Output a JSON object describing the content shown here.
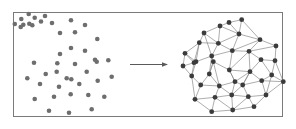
{
  "figure": {
    "background_color": "#ffffff",
    "frame": {
      "x": 13.5,
      "y": 12.5,
      "width": 269,
      "height": 104,
      "stroke": "#7a7a7a",
      "stroke_width": 1,
      "fill": "#ffffff"
    },
    "colors": {
      "point_fill": "#6e6e6e",
      "node_fill": "#3b3b3b",
      "edge_stroke": "#8a8a8a",
      "arrow_stroke": "#5a5a5a",
      "frame_stroke": "#7a7a7a"
    }
  },
  "left_panel": {
    "label": "scattered-point-cloud",
    "point_radius": 2.3,
    "point_count": 44,
    "points": [
      {
        "x": 28.7,
        "y": 14.0
      },
      {
        "x": 34.7,
        "y": 17.7
      },
      {
        "x": 21.3,
        "y": 19.0
      },
      {
        "x": 23.3,
        "y": 24.7
      },
      {
        "x": 20.7,
        "y": 27.0
      },
      {
        "x": 14.8,
        "y": 24.0
      },
      {
        "x": 29.3,
        "y": 23.7
      },
      {
        "x": 32.3,
        "y": 25.3
      },
      {
        "x": 45.0,
        "y": 16.0
      },
      {
        "x": 41.0,
        "y": 21.5
      },
      {
        "x": 52.0,
        "y": 23.0
      },
      {
        "x": 60.0,
        "y": 33.0
      },
      {
        "x": 71.0,
        "y": 20.3
      },
      {
        "x": 75.0,
        "y": 32.3
      },
      {
        "x": 85.0,
        "y": 25.0
      },
      {
        "x": 97.3,
        "y": 39.0
      },
      {
        "x": 71.0,
        "y": 48.0
      },
      {
        "x": 85.0,
        "y": 50.7
      },
      {
        "x": 60.0,
        "y": 54.0
      },
      {
        "x": 95.0,
        "y": 59.7
      },
      {
        "x": 108.3,
        "y": 60.3
      },
      {
        "x": 34.0,
        "y": 62.7
      },
      {
        "x": 57.3,
        "y": 63.3
      },
      {
        "x": 27.3,
        "y": 78.3
      },
      {
        "x": 45.7,
        "y": 74.0
      },
      {
        "x": 56.7,
        "y": 71.7
      },
      {
        "x": 71.3,
        "y": 79.3
      },
      {
        "x": 40.0,
        "y": 84.0
      },
      {
        "x": 59.0,
        "y": 86.7
      },
      {
        "x": 34.7,
        "y": 99.0
      },
      {
        "x": 54.0,
        "y": 96.7
      },
      {
        "x": 70.7,
        "y": 94.3
      },
      {
        "x": 49.0,
        "y": 110.7
      },
      {
        "x": 69.0,
        "y": 112.7
      },
      {
        "x": 75.0,
        "y": 64.0
      },
      {
        "x": 96.7,
        "y": 61.7
      },
      {
        "x": 86.7,
        "y": 71.7
      },
      {
        "x": 66.7,
        "y": 78.3
      },
      {
        "x": 97.7,
        "y": 80.7
      },
      {
        "x": 79.3,
        "y": 84.0
      },
      {
        "x": 88.3,
        "y": 95.0
      },
      {
        "x": 104.3,
        "y": 96.7
      },
      {
        "x": 91.7,
        "y": 109.3
      },
      {
        "x": 111.7,
        "y": 76.7
      }
    ]
  },
  "arrow": {
    "label": "transformation-arrow",
    "x1": 130,
    "y1": 64.5,
    "x2": 168,
    "y2": 64.5,
    "head_length": 6,
    "head_width": 4.5,
    "stroke_width": 1
  },
  "right_panel": {
    "label": "connected-graph",
    "node_radius": 2.4,
    "node_count": 38,
    "edge_count": 92,
    "nodes": [
      {
        "id": 0,
        "x": 220.0,
        "y": 26.0
      },
      {
        "id": 1,
        "x": 241.7,
        "y": 19.7
      },
      {
        "id": 2,
        "x": 199.3,
        "y": 42.7
      },
      {
        "id": 3,
        "x": 218.3,
        "y": 43.3
      },
      {
        "id": 4,
        "x": 239.0,
        "y": 34.0
      },
      {
        "id": 5,
        "x": 260.0,
        "y": 39.7
      },
      {
        "id": 6,
        "x": 185.0,
        "y": 53.3
      },
      {
        "id": 7,
        "x": 196.0,
        "y": 61.7
      },
      {
        "id": 8,
        "x": 211.7,
        "y": 56.0
      },
      {
        "id": 9,
        "x": 232.3,
        "y": 50.7
      },
      {
        "id": 10,
        "x": 249.0,
        "y": 51.3
      },
      {
        "id": 11,
        "x": 261.0,
        "y": 59.7
      },
      {
        "id": 12,
        "x": 275.0,
        "y": 60.7
      },
      {
        "id": 13,
        "x": 194.0,
        "y": 62.7
      },
      {
        "id": 14,
        "x": 213.3,
        "y": 61.7
      },
      {
        "id": 15,
        "x": 229.3,
        "y": 70.0
      },
      {
        "id": 16,
        "x": 191.7,
        "y": 76.0
      },
      {
        "id": 17,
        "x": 209.3,
        "y": 74.0
      },
      {
        "id": 18,
        "x": 250.0,
        "y": 71.7
      },
      {
        "id": 19,
        "x": 271.7,
        "y": 75.0
      },
      {
        "id": 20,
        "x": 200.7,
        "y": 85.0
      },
      {
        "id": 21,
        "x": 219.3,
        "y": 86.0
      },
      {
        "id": 22,
        "x": 235.0,
        "y": 81.7
      },
      {
        "id": 23,
        "x": 261.7,
        "y": 80.7
      },
      {
        "id": 24,
        "x": 283.3,
        "y": 81.7
      },
      {
        "id": 25,
        "x": 242.7,
        "y": 85.0
      },
      {
        "id": 26,
        "x": 195.0,
        "y": 99.3
      },
      {
        "id": 27,
        "x": 215.0,
        "y": 97.3
      },
      {
        "id": 28,
        "x": 231.7,
        "y": 95.0
      },
      {
        "id": 29,
        "x": 248.3,
        "y": 96.7
      },
      {
        "id": 30,
        "x": 266.0,
        "y": 95.0
      },
      {
        "id": 31,
        "x": 211.7,
        "y": 111.7
      },
      {
        "id": 32,
        "x": 232.7,
        "y": 110.0
      },
      {
        "id": 33,
        "x": 254.0,
        "y": 106.7
      },
      {
        "id": 34,
        "x": 183.0,
        "y": 66.0
      },
      {
        "id": 35,
        "x": 276.0,
        "y": 46.0
      },
      {
        "id": 36,
        "x": 204.0,
        "y": 33.0
      },
      {
        "id": 37,
        "x": 229.0,
        "y": 22.5
      }
    ],
    "edges": [
      [
        0,
        37
      ],
      [
        0,
        36
      ],
      [
        0,
        3
      ],
      [
        0,
        4
      ],
      [
        37,
        1
      ],
      [
        37,
        4
      ],
      [
        1,
        4
      ],
      [
        1,
        5
      ],
      [
        36,
        2
      ],
      [
        36,
        3
      ],
      [
        2,
        3
      ],
      [
        2,
        6
      ],
      [
        2,
        13
      ],
      [
        3,
        4
      ],
      [
        3,
        8
      ],
      [
        3,
        9
      ],
      [
        4,
        9
      ],
      [
        4,
        5
      ],
      [
        5,
        9
      ],
      [
        5,
        10
      ],
      [
        5,
        35
      ],
      [
        35,
        12
      ],
      [
        35,
        10
      ],
      [
        6,
        7
      ],
      [
        6,
        13
      ],
      [
        6,
        34
      ],
      [
        7,
        8
      ],
      [
        7,
        13
      ],
      [
        7,
        16
      ],
      [
        8,
        9
      ],
      [
        8,
        14
      ],
      [
        8,
        17
      ],
      [
        9,
        10
      ],
      [
        9,
        15
      ],
      [
        10,
        11
      ],
      [
        10,
        15
      ],
      [
        10,
        18
      ],
      [
        11,
        12
      ],
      [
        11,
        18
      ],
      [
        11,
        19
      ],
      [
        12,
        19
      ],
      [
        12,
        24
      ],
      [
        13,
        16
      ],
      [
        13,
        34
      ],
      [
        14,
        15
      ],
      [
        14,
        17
      ],
      [
        14,
        21
      ],
      [
        15,
        18
      ],
      [
        15,
        22
      ],
      [
        16,
        20
      ],
      [
        16,
        26
      ],
      [
        16,
        34
      ],
      [
        17,
        20
      ],
      [
        17,
        21
      ],
      [
        18,
        22
      ],
      [
        18,
        23
      ],
      [
        18,
        25
      ],
      [
        19,
        23
      ],
      [
        19,
        24
      ],
      [
        20,
        21
      ],
      [
        20,
        26
      ],
      [
        21,
        22
      ],
      [
        21,
        27
      ],
      [
        22,
        25
      ],
      [
        22,
        28
      ],
      [
        23,
        24
      ],
      [
        23,
        25
      ],
      [
        23,
        30
      ],
      [
        24,
        30
      ],
      [
        25,
        28
      ],
      [
        25,
        29
      ],
      [
        26,
        27
      ],
      [
        26,
        31
      ],
      [
        27,
        28
      ],
      [
        27,
        31
      ],
      [
        28,
        29
      ],
      [
        28,
        32
      ],
      [
        29,
        30
      ],
      [
        29,
        33
      ],
      [
        30,
        33
      ],
      [
        31,
        32
      ],
      [
        32,
        33
      ],
      [
        29,
        32
      ],
      [
        17,
        14
      ],
      [
        8,
        36
      ],
      [
        13,
        7
      ],
      [
        2,
        7
      ],
      [
        22,
        15
      ],
      [
        25,
        18
      ],
      [
        21,
        28
      ],
      [
        27,
        32
      ],
      [
        30,
        19
      ]
    ]
  }
}
